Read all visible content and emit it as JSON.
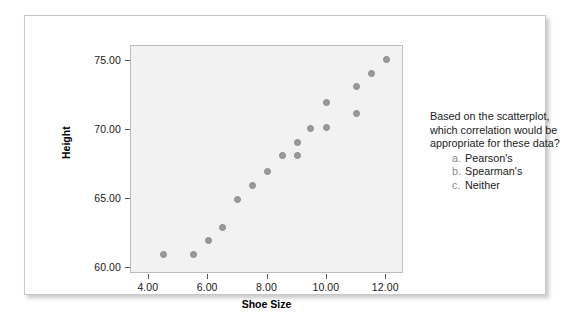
{
  "slide": {
    "background_color": "#ffffff",
    "card_border_color": "#c8c8c8"
  },
  "question": {
    "lines": [
      "Based on the scatterplot,",
      "which correlation would be",
      "appropriate for these data?"
    ],
    "choices": [
      {
        "letter": "a.",
        "text": "Pearson's"
      },
      {
        "letter": "b.",
        "text": "Spearman's"
      },
      {
        "letter": "c.",
        "text": "Neither"
      }
    ]
  },
  "chart_data": {
    "type": "scatter",
    "title": "",
    "xlabel": "Shoe Size",
    "ylabel": "Height",
    "xlim": [
      3.4,
      12.6
    ],
    "ylim": [
      59.6,
      76.1
    ],
    "xticks": [
      "4.00",
      "6.00",
      "8.00",
      "10.00",
      "12.00"
    ],
    "xtick_values": [
      4,
      6,
      8,
      10,
      12
    ],
    "yticks": [
      "60.00",
      "65.00",
      "70.00",
      "75.00"
    ],
    "ytick_values": [
      60,
      65,
      70,
      75
    ],
    "grid": false,
    "legend": null,
    "plot_background": "#f2f2f2",
    "marker_color": "#9a9a9a",
    "points": [
      {
        "x": 4.5,
        "y": 61.0
      },
      {
        "x": 5.5,
        "y": 61.0
      },
      {
        "x": 6.0,
        "y": 62.0
      },
      {
        "x": 6.5,
        "y": 63.0
      },
      {
        "x": 7.0,
        "y": 65.0
      },
      {
        "x": 7.5,
        "y": 66.0
      },
      {
        "x": 8.0,
        "y": 67.0
      },
      {
        "x": 8.5,
        "y": 68.2
      },
      {
        "x": 9.0,
        "y": 68.2
      },
      {
        "x": 9.0,
        "y": 69.1
      },
      {
        "x": 9.45,
        "y": 70.1
      },
      {
        "x": 10.0,
        "y": 70.2
      },
      {
        "x": 10.0,
        "y": 72.0
      },
      {
        "x": 11.0,
        "y": 71.2
      },
      {
        "x": 11.0,
        "y": 73.2
      },
      {
        "x": 11.5,
        "y": 74.1
      },
      {
        "x": 12.0,
        "y": 75.1
      }
    ]
  }
}
